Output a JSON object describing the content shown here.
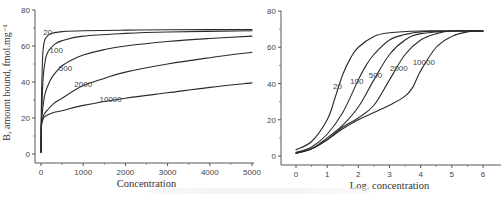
{
  "figure": {
    "caption_visible": false
  },
  "chart_data": [
    {
      "id": "left",
      "type": "line",
      "title": "",
      "xlabel": "Concentration",
      "ylabel": "B, amount bound, fmol.mg⁻¹",
      "xlim": [
        0,
        5000
      ],
      "ylim": [
        0,
        80
      ],
      "xticks": [
        0,
        1000,
        2000,
        3000,
        4000,
        5000
      ],
      "xtick_labels": [
        "0",
        "1000",
        "2000",
        "3000",
        "4000",
        "5000"
      ],
      "yticks": [
        0,
        20,
        40,
        60,
        80
      ],
      "ytick_labels": [
        "0",
        "20",
        "40",
        "60",
        "80"
      ],
      "grid": false,
      "legend": "inline labels",
      "series": [
        {
          "name": "20",
          "label_at": [
            160,
            66
          ],
          "x": [
            0,
            5,
            10,
            20,
            35,
            50,
            75,
            100,
            150,
            200,
            300,
            500,
            1000,
            2000,
            3000,
            5000
          ],
          "y": [
            1,
            18,
            28,
            40,
            52,
            58,
            62,
            64,
            65.5,
            66.5,
            67.3,
            68,
            68.5,
            68.8,
            69,
            69.2
          ]
        },
        {
          "name": "100",
          "label_at": [
            360,
            56
          ],
          "x": [
            0,
            5,
            10,
            20,
            50,
            100,
            150,
            200,
            300,
            500,
            1000,
            2000,
            3000,
            5000
          ],
          "y": [
            1,
            15,
            20,
            25,
            42,
            52,
            56,
            58,
            60.5,
            63,
            65.5,
            67,
            67.8,
            68.5
          ]
        },
        {
          "name": "500",
          "label_at": [
            580,
            46
          ],
          "x": [
            0,
            5,
            10,
            20,
            50,
            100,
            200,
            300,
            500,
            750,
            1000,
            1500,
            2000,
            3000,
            4000,
            5000
          ],
          "y": [
            1,
            14,
            17,
            20,
            27,
            34,
            40,
            44,
            49,
            52.5,
            55,
            58,
            60,
            62.5,
            64.2,
            65.5
          ]
        },
        {
          "name": "2000",
          "label_at": [
            1000,
            37
          ],
          "x": [
            0,
            5,
            10,
            20,
            50,
            100,
            300,
            500,
            1000,
            1500,
            2000,
            3000,
            4000,
            5000
          ],
          "y": [
            1,
            13,
            16,
            18,
            20.5,
            23,
            28,
            31,
            38,
            42,
            45.5,
            50,
            53.5,
            56.5
          ]
        },
        {
          "name": "10000",
          "label_at": [
            1650,
            29
          ],
          "x": [
            0,
            5,
            10,
            20,
            50,
            100,
            300,
            500,
            1000,
            2000,
            3000,
            4000,
            5000
          ],
          "y": [
            1,
            12,
            15,
            17,
            19.5,
            21,
            23,
            24,
            27,
            31,
            34,
            37,
            39.5
          ]
        }
      ]
    },
    {
      "id": "right",
      "type": "line",
      "title": "",
      "xlabel": "Log. concentration",
      "ylabel": "",
      "xlim": [
        -0.5,
        6.5
      ],
      "ylim": [
        0,
        80
      ],
      "xticks": [
        0,
        1,
        2,
        3,
        4,
        5,
        6
      ],
      "xtick_labels": [
        "0",
        "1",
        "2",
        "3",
        "4",
        "5",
        "6"
      ],
      "yticks": [
        0,
        20,
        40,
        60,
        80
      ],
      "ytick_labels": [
        "0",
        "20",
        "40",
        "60",
        "80"
      ],
      "grid": false,
      "legend": "inline labels",
      "series": [
        {
          "name": "20",
          "label_at": [
            1.33,
            37
          ],
          "x": [
            0,
            0.5,
            1,
            1.25,
            1.5,
            1.75,
            2,
            2.5,
            3,
            4,
            5,
            6
          ],
          "y": [
            3.5,
            8,
            20,
            32,
            45,
            54,
            60,
            66,
            68,
            69,
            69,
            69
          ]
        },
        {
          "name": "100",
          "label_at": [
            1.95,
            40
          ],
          "x": [
            0,
            0.5,
            1,
            1.5,
            2,
            2.25,
            2.5,
            3,
            3.5,
            4,
            5,
            6
          ],
          "y": [
            2,
            5,
            12,
            24,
            42,
            50,
            56,
            64,
            67,
            68.5,
            69,
            69
          ]
        },
        {
          "name": "500",
          "label_at": [
            2.55,
            43
          ],
          "x": [
            0,
            0.5,
            1,
            1.5,
            2,
            2.5,
            3,
            3.5,
            4,
            5,
            6
          ],
          "y": [
            1.5,
            4,
            10,
            17,
            27,
            42,
            56,
            64,
            67.5,
            69,
            69
          ]
        },
        {
          "name": "2000",
          "label_at": [
            3.3,
            47
          ],
          "x": [
            0,
            0.5,
            1,
            1.5,
            2,
            2.5,
            3,
            3.5,
            4,
            4.5,
            5,
            6
          ],
          "y": [
            1.5,
            4,
            9,
            16,
            21,
            28,
            42,
            56,
            64,
            67.5,
            69,
            69
          ]
        },
        {
          "name": "10000",
          "label_at": [
            4.1,
            50
          ],
          "x": [
            0,
            0.5,
            1,
            1.5,
            2,
            2.5,
            3,
            3.5,
            3.75,
            4,
            4.5,
            5,
            5.5,
            6
          ],
          "y": [
            1.5,
            4,
            9,
            15,
            20,
            24,
            28,
            33,
            38,
            47,
            60,
            66,
            68.5,
            69
          ]
        }
      ]
    }
  ]
}
